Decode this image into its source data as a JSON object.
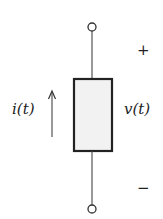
{
  "diagram": {
    "type": "circuit-element",
    "element": {
      "shape": "rectangle",
      "fill": "#f2f2f2",
      "stroke": "#222222"
    },
    "current_label": "i(t)",
    "voltage_label": "v(t)",
    "plus_sign": "+",
    "minus_sign": "−",
    "current_direction": "up",
    "terminals": [
      "top",
      "bottom"
    ]
  }
}
